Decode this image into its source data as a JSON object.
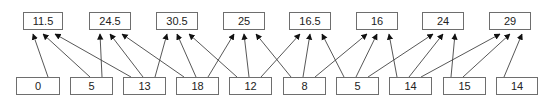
{
  "diagram": {
    "type": "sliding-window aggregation",
    "window_size": 3,
    "colors": {
      "border": "#6e6e6e",
      "arrow": "#444444",
      "text": "#222222",
      "background": "#ffffff"
    },
    "outputs": [
      {
        "label": "11.5",
        "x": 23,
        "y": 12,
        "w": 40
      },
      {
        "label": "24.5",
        "x": 89,
        "y": 12,
        "w": 42
      },
      {
        "label": "30.5",
        "x": 156,
        "y": 12,
        "w": 42
      },
      {
        "label": "25",
        "x": 223,
        "y": 12,
        "w": 42
      },
      {
        "label": "16.5",
        "x": 289,
        "y": 12,
        "w": 42
      },
      {
        "label": "16",
        "x": 356,
        "y": 12,
        "w": 42
      },
      {
        "label": "24",
        "x": 422,
        "y": 12,
        "w": 42
      },
      {
        "label": "29",
        "x": 489,
        "y": 12,
        "w": 42
      }
    ],
    "inputs": [
      {
        "label": "0",
        "x": 16,
        "y": 77,
        "w": 44
      },
      {
        "label": "5",
        "x": 70,
        "y": 77,
        "w": 43
      },
      {
        "label": "13",
        "x": 123,
        "y": 77,
        "w": 43
      },
      {
        "label": "18",
        "x": 176,
        "y": 77,
        "w": 43
      },
      {
        "label": "12",
        "x": 229,
        "y": 77,
        "w": 43
      },
      {
        "label": "8",
        "x": 283,
        "y": 77,
        "w": 43
      },
      {
        "label": "5",
        "x": 336,
        "y": 77,
        "w": 43
      },
      {
        "label": "14",
        "x": 389,
        "y": 77,
        "w": 43
      },
      {
        "label": "15",
        "x": 443,
        "y": 77,
        "w": 43
      },
      {
        "label": "14",
        "x": 496,
        "y": 77,
        "w": 42
      }
    ],
    "edges": [
      [
        0,
        0
      ],
      [
        1,
        0
      ],
      [
        2,
        0
      ],
      [
        1,
        1
      ],
      [
        2,
        1
      ],
      [
        3,
        1
      ],
      [
        2,
        2
      ],
      [
        3,
        2
      ],
      [
        4,
        2
      ],
      [
        3,
        3
      ],
      [
        4,
        3
      ],
      [
        5,
        3
      ],
      [
        4,
        4
      ],
      [
        5,
        4
      ],
      [
        6,
        4
      ],
      [
        5,
        5
      ],
      [
        6,
        5
      ],
      [
        7,
        5
      ],
      [
        6,
        6
      ],
      [
        7,
        6
      ],
      [
        8,
        6
      ],
      [
        7,
        7
      ],
      [
        8,
        7
      ],
      [
        9,
        7
      ]
    ]
  }
}
